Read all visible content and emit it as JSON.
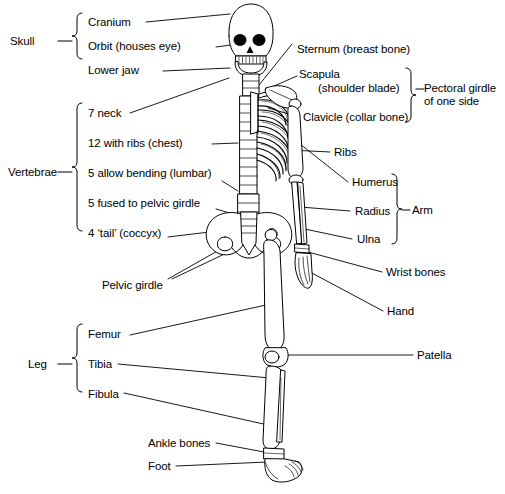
{
  "diagram": {
    "background_color": "#ffffff",
    "line_color": "#000000",
    "text_color": "#000000"
  },
  "group_labels": [
    {
      "id": "skull",
      "text": "Skull"
    },
    {
      "id": "vertebrae",
      "text": "Vertebrae"
    },
    {
      "id": "leg",
      "text": "Leg"
    },
    {
      "id": "pectoral-girdle",
      "text": "Pectoral girdle\nof one side"
    },
    {
      "id": "arm",
      "text": "Arm"
    }
  ],
  "labels_left": [
    {
      "id": "cranium",
      "text": "Cranium"
    },
    {
      "id": "orbit",
      "text": "Orbit (houses eye)"
    },
    {
      "id": "lower-jaw",
      "text": "Lower jaw"
    },
    {
      "id": "neck",
      "text": "7 neck"
    },
    {
      "id": "chest",
      "text": "12 with ribs (chest)"
    },
    {
      "id": "lumbar",
      "text": "5 allow bending (lumbar)"
    },
    {
      "id": "sacrum",
      "text": "5 fused to pelvic girdle"
    },
    {
      "id": "coccyx",
      "text": "4 ‘tail’ (coccyx)"
    },
    {
      "id": "pelvic-girdle",
      "text": "Pelvic girdle"
    },
    {
      "id": "femur",
      "text": "Femur"
    },
    {
      "id": "tibia",
      "text": "Tibia"
    },
    {
      "id": "fibula",
      "text": "Fibula"
    },
    {
      "id": "ankle-bones",
      "text": "Ankle bones"
    },
    {
      "id": "foot",
      "text": "Foot"
    }
  ],
  "labels_right": [
    {
      "id": "sternum",
      "text": "Sternum (breast bone)"
    },
    {
      "id": "scapula",
      "text": "Scapula"
    },
    {
      "id": "scapula-sub",
      "text": "(shoulder blade)"
    },
    {
      "id": "clavicle",
      "text": "Clavicle (collar bone)"
    },
    {
      "id": "ribs",
      "text": "Ribs"
    },
    {
      "id": "humerus",
      "text": "Humerus"
    },
    {
      "id": "radius",
      "text": "Radius"
    },
    {
      "id": "ulna",
      "text": "Ulna"
    },
    {
      "id": "wrist-bones",
      "text": "Wrist bones"
    },
    {
      "id": "hand",
      "text": "Hand"
    },
    {
      "id": "patella",
      "text": "Patella"
    }
  ]
}
